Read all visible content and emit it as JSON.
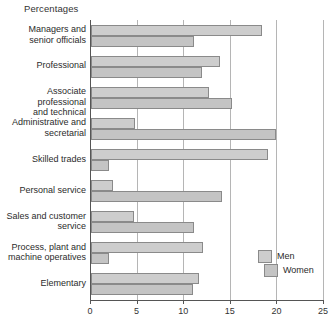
{
  "chart_data": {
    "type": "bar",
    "orientation": "horizontal",
    "title": "Percentages",
    "xlabel": "",
    "ylabel": "",
    "xlim": [
      0,
      25
    ],
    "xticks": [
      0,
      5,
      10,
      15,
      20,
      25
    ],
    "xtick_labels": [
      "0",
      "5",
      "10",
      "15",
      "20",
      "25"
    ],
    "grid": true,
    "legend_position": "bottom-right",
    "categories": [
      "Managers and senior officials",
      "Professional",
      "Associate professional and technical",
      "Administrative and secretarial",
      "Skilled trades",
      "Personal service",
      "Sales and customer service",
      "Process, plant and machine operatives",
      "Elementary"
    ],
    "series": [
      {
        "name": "Men",
        "color": "#cdcdcd",
        "values": [
          18.4,
          13.8,
          12.7,
          4.7,
          19.0,
          2.4,
          4.6,
          12.0,
          11.6
        ]
      },
      {
        "name": "Women",
        "color": "#c4c4c4",
        "values": [
          11.0,
          11.9,
          15.1,
          19.9,
          1.9,
          14.1,
          11.0,
          1.9,
          10.9
        ]
      }
    ]
  },
  "category_label_lines": [
    [
      "Managers and",
      "senior officials"
    ],
    [
      "Professional"
    ],
    [
      "Associate professional",
      "and technical"
    ],
    [
      "Administrative and",
      "secretarial"
    ],
    [
      "Skilled trades"
    ],
    [
      "Personal service"
    ],
    [
      "Sales and customer",
      "service"
    ],
    [
      "Process, plant and",
      "machine operatives"
    ],
    [
      "Elementary"
    ]
  ],
  "legend": {
    "items": [
      {
        "label": "Men",
        "color": "#cdcdcd"
      },
      {
        "label": "Women",
        "color": "#c4c4c4"
      }
    ]
  },
  "colors": {
    "bar_fill_men": "#cdcdcd",
    "bar_fill_women": "#c4c4c4",
    "bar_border": "#8a8a8a",
    "gridline": "#b5b5b5",
    "axis": "#555555",
    "text": "#2b2b2b",
    "background": "#ffffff"
  }
}
